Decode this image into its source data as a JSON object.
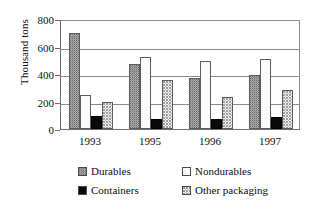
{
  "chart_data": {
    "type": "bar",
    "title": "",
    "subtitle": "",
    "xlabel": "",
    "ylabel": "Thousand tons",
    "ylim": [
      0,
      800
    ],
    "ytick_step": 200,
    "yticks": [
      "0",
      "200",
      "400",
      "600",
      "800"
    ],
    "grid": true,
    "legend_position": "bottom",
    "categories": [
      "1993",
      "1995",
      "1996",
      "1997"
    ],
    "series": [
      {
        "name": "Durables",
        "values": [
          700,
          475,
          370,
          395
        ],
        "swatch_color": "#a8a8a8",
        "pattern": "dotted-gray"
      },
      {
        "name": "Nondurables",
        "values": [
          250,
          525,
          495,
          510
        ],
        "swatch_color": "#fbfbfb",
        "pattern": "vertical-hairline"
      },
      {
        "name": "Containers",
        "values": [
          95,
          70,
          75,
          90
        ],
        "swatch_color": "#0a0a0a",
        "pattern": "solid-black"
      },
      {
        "name": "Other packaging",
        "values": [
          195,
          360,
          235,
          285
        ],
        "swatch_color": "#f2f2f2",
        "pattern": "speckled-light"
      }
    ]
  },
  "axis": {
    "y_title": "Thousand tons",
    "y_ticks": [
      {
        "label": "800",
        "value": 800
      },
      {
        "label": "600",
        "value": 600
      },
      {
        "label": "400",
        "value": 400
      },
      {
        "label": "200",
        "value": 200
      },
      {
        "label": "0",
        "value": 0
      }
    ],
    "x_labels": [
      "1993",
      "1995",
      "1996",
      "1997"
    ]
  },
  "legend": {
    "items": [
      {
        "label": "Durables"
      },
      {
        "label": "Nondurables"
      },
      {
        "label": "Containers"
      },
      {
        "label": "Other packaging"
      }
    ]
  },
  "colors": {
    "axis": "#6f6f6f",
    "gridline": "#8a8a8a",
    "text": "#0d0d0d",
    "background": "#ffffff"
  }
}
